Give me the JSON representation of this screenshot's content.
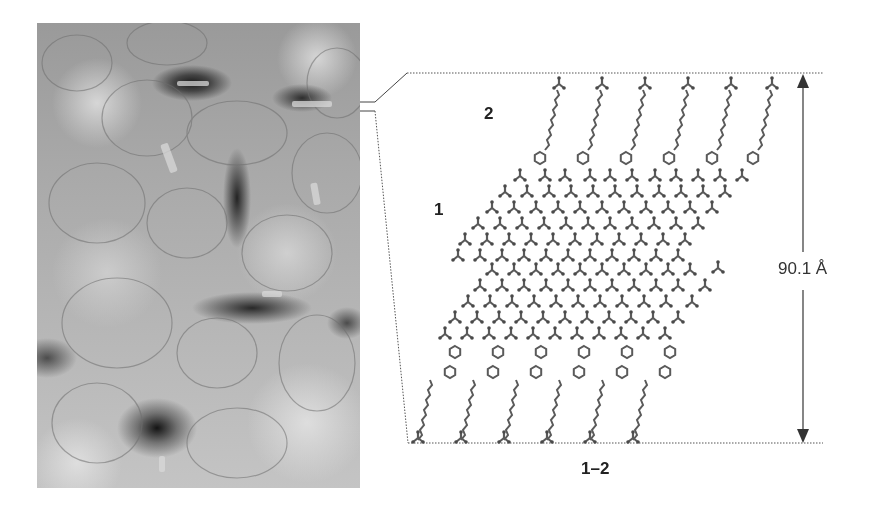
{
  "figure": {
    "micrograph": {
      "description": "TEM micrograph of plate-like crystallites",
      "tone": "grayscale"
    },
    "model": {
      "label_layer_1": "1",
      "label_layer_2": "2",
      "caption": "1–2",
      "dimension": "90.1 Å"
    },
    "colors": {
      "background": "#ffffff",
      "molecule": "#5a5a5a",
      "dotted_line": "#555555",
      "arrow": "#333333",
      "text": "#222222"
    }
  }
}
